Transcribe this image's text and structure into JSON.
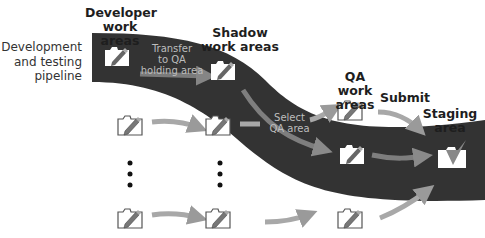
{
  "labels": {
    "pipeline": [
      "Development",
      "and testing",
      "pipeline"
    ],
    "developer": [
      "Developer",
      "work areas"
    ],
    "shadow": [
      "Shadow",
      "work areas"
    ],
    "qa": [
      "QA",
      "work areas"
    ],
    "submit": "Submit",
    "staging": [
      "Staging",
      "area"
    ],
    "transfer": [
      "Transfer",
      "to QA",
      "holding area"
    ],
    "select": [
      "Select",
      "QA area"
    ]
  },
  "icons": {
    "workarea": "folder-pencil-icon",
    "staging": "folder-checkmark-icon",
    "ellipsis": "vertical-dots"
  },
  "colors": {
    "band": "#333333",
    "arrow": "#9a9a9a",
    "text": "#1e1e1e",
    "inband_text": "#bdbdbd"
  }
}
